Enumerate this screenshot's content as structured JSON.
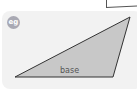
{
  "badge": {
    "label": "eg",
    "color": "#a9a9b3"
  },
  "diagram": {
    "shape": "triangle",
    "fill": "#c8c8c8",
    "stroke": "#333333",
    "vertices": [
      [
        15,
        77
      ],
      [
        130,
        17
      ],
      [
        113,
        77
      ]
    ],
    "base_label": "base"
  },
  "panel": {
    "background": "#f2f2f2"
  }
}
